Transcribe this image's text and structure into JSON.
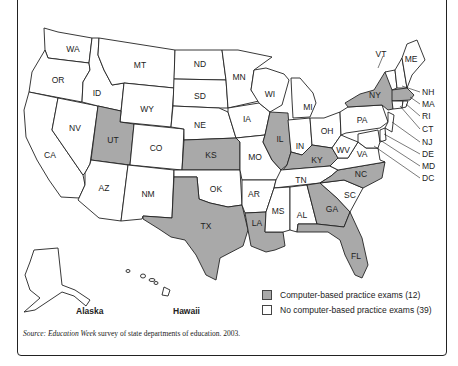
{
  "map": {
    "states": [
      {
        "code": "WA",
        "shaded": false
      },
      {
        "code": "OR",
        "shaded": false
      },
      {
        "code": "CA",
        "shaded": false
      },
      {
        "code": "NV",
        "shaded": false
      },
      {
        "code": "ID",
        "shaded": false
      },
      {
        "code": "MT",
        "shaded": false
      },
      {
        "code": "WY",
        "shaded": false
      },
      {
        "code": "UT",
        "shaded": true
      },
      {
        "code": "CO",
        "shaded": false
      },
      {
        "code": "AZ",
        "shaded": false
      },
      {
        "code": "NM",
        "shaded": false
      },
      {
        "code": "ND",
        "shaded": false
      },
      {
        "code": "SD",
        "shaded": false
      },
      {
        "code": "NE",
        "shaded": false
      },
      {
        "code": "KS",
        "shaded": true
      },
      {
        "code": "OK",
        "shaded": false
      },
      {
        "code": "TX",
        "shaded": true
      },
      {
        "code": "MN",
        "shaded": false
      },
      {
        "code": "IA",
        "shaded": false
      },
      {
        "code": "MO",
        "shaded": false
      },
      {
        "code": "AR",
        "shaded": false
      },
      {
        "code": "LA",
        "shaded": true
      },
      {
        "code": "WI",
        "shaded": false
      },
      {
        "code": "IL",
        "shaded": true
      },
      {
        "code": "MI",
        "shaded": false
      },
      {
        "code": "IN",
        "shaded": false
      },
      {
        "code": "OH",
        "shaded": false
      },
      {
        "code": "KY",
        "shaded": true
      },
      {
        "code": "TN",
        "shaded": false
      },
      {
        "code": "MS",
        "shaded": false
      },
      {
        "code": "AL",
        "shaded": false
      },
      {
        "code": "GA",
        "shaded": true
      },
      {
        "code": "FL",
        "shaded": true
      },
      {
        "code": "SC",
        "shaded": false
      },
      {
        "code": "NC",
        "shaded": true
      },
      {
        "code": "VA",
        "shaded": false
      },
      {
        "code": "WV",
        "shaded": false
      },
      {
        "code": "PA",
        "shaded": false
      },
      {
        "code": "NY",
        "shaded": true
      },
      {
        "code": "VT",
        "shaded": false
      },
      {
        "code": "ME",
        "shaded": false
      },
      {
        "code": "NH",
        "shaded": false
      },
      {
        "code": "MA",
        "shaded": true
      },
      {
        "code": "RI",
        "shaded": false
      },
      {
        "code": "CT",
        "shaded": false
      },
      {
        "code": "NJ",
        "shaded": false
      },
      {
        "code": "DE",
        "shaded": false
      },
      {
        "code": "MD",
        "shaded": false
      },
      {
        "code": "DC",
        "shaded": false
      },
      {
        "code": "AK",
        "shaded": false
      },
      {
        "code": "HI",
        "shaded": false
      }
    ],
    "labels": {
      "WA": "WA",
      "OR": "OR",
      "CA": "CA",
      "NV": "NV",
      "ID": "ID",
      "MT": "MT",
      "WY": "WY",
      "UT": "UT",
      "CO": "CO",
      "AZ": "AZ",
      "NM": "NM",
      "ND": "ND",
      "SD": "SD",
      "NE": "NE",
      "KS": "KS",
      "OK": "OK",
      "TX": "TX",
      "MN": "MN",
      "IA": "IA",
      "MO": "MO",
      "AR": "AR",
      "LA": "LA",
      "WI": "WI",
      "IL": "IL",
      "MI": "MI",
      "IN": "IN",
      "OH": "OH",
      "KY": "KY",
      "TN": "TN",
      "MS": "MS",
      "AL": "AL",
      "GA": "GA",
      "FL": "FL",
      "SC": "SC",
      "NC": "NC",
      "VA": "VA",
      "WV": "WV",
      "PA": "PA",
      "NY": "NY",
      "VT": "VT",
      "ME": "ME",
      "NH": "NH",
      "MA": "MA",
      "RI": "RI",
      "CT": "CT",
      "NJ": "NJ",
      "DE": "DE",
      "MD": "MD",
      "DC": "DC"
    },
    "insets": {
      "alaska": "Alaska",
      "hawaii": "Hawaii"
    },
    "colors": {
      "shaded": "#a9a9a9",
      "unshaded": "#ffffff",
      "border": "#222222"
    }
  },
  "legend": {
    "items": [
      {
        "label": "Computer-based practice exams (12)",
        "color": "#a9a9a9"
      },
      {
        "label": "No computer-based practice exams (39)",
        "color": "#ffffff"
      }
    ]
  },
  "source": {
    "prefix": "Source: ",
    "publication": "Education Week",
    "rest": " survey of state departments of education. 2003."
  }
}
